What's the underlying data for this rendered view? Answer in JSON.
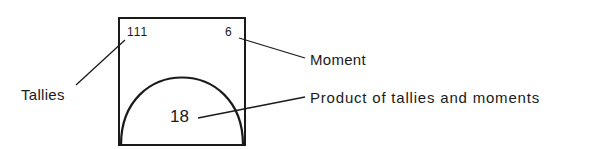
{
  "diagram": {
    "box": {
      "tallies_value": "111",
      "moment_value": "6",
      "product_value": "18"
    },
    "labels": {
      "tallies": "Tallies",
      "moment": "Moment",
      "product": "Product of tallies and moments"
    },
    "colors": {
      "stroke": "#1a1a1a",
      "background": "#ffffff"
    }
  }
}
